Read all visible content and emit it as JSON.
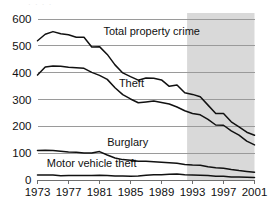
{
  "chart_data": {
    "type": "line",
    "title": "",
    "subtitle": "",
    "xlabel": "",
    "ylabel": "",
    "xlim": [
      1973,
      2001
    ],
    "ylim": [
      0,
      600
    ],
    "grid": true,
    "legend_position": "inline-labels",
    "x_tick_labels": [
      "1973",
      "1977",
      "1981",
      "1985",
      "1989",
      "1993",
      "1997",
      "2001"
    ],
    "x_ticks": [
      1973,
      1977,
      1981,
      1985,
      1989,
      1993,
      1997,
      2001
    ],
    "y_tick_labels": [
      "0",
      "100",
      "200",
      "300",
      "400",
      "500",
      "600"
    ],
    "y_ticks": [
      0,
      100,
      200,
      300,
      400,
      500,
      600
    ],
    "x": [
      1973,
      1974,
      1975,
      1976,
      1977,
      1978,
      1979,
      1980,
      1981,
      1982,
      1983,
      1984,
      1985,
      1986,
      1987,
      1988,
      1989,
      1990,
      1991,
      1992,
      1993,
      1994,
      1995,
      1996,
      1997,
      1998,
      1999,
      2000,
      2001
    ],
    "shaded_region": {
      "x_start": 1992.3,
      "x_end": 2001,
      "color": "#d2d2d2",
      "note": "redesign of survey methodology"
    },
    "series": [
      {
        "name": "Total property crime",
        "label": "Total property crime",
        "label_x": 1981.5,
        "label_y": 540,
        "color": "#111111",
        "values": [
          519,
          543,
          553,
          545,
          541,
          532,
          532,
          496,
          497,
          468,
          429,
          399,
          385,
          372,
          380,
          379,
          373,
          349,
          354,
          325,
          319,
          310,
          279,
          248,
          248,
          217,
          198,
          178,
          167
        ]
      },
      {
        "name": "Theft",
        "label": "Theft",
        "label_x": 1983.5,
        "label_y": 345,
        "color": "#111111",
        "values": [
          391,
          421,
          425,
          424,
          420,
          418,
          416,
          401,
          390,
          375,
          344,
          318,
          302,
          288,
          291,
          294,
          289,
          283,
          272,
          258,
          248,
          243,
          226,
          205,
          204,
          183,
          167,
          145,
          131
        ]
      },
      {
        "name": "Burglary",
        "label": "Burglary",
        "label_x": 1982.0,
        "label_y": 128,
        "color": "#111111",
        "values": [
          110,
          111,
          110,
          107,
          104,
          103,
          101,
          101,
          106,
          93,
          82,
          76,
          74,
          70,
          70,
          68,
          66,
          64,
          62,
          58,
          56,
          55,
          49,
          46,
          44,
          39,
          35,
          32,
          29
        ]
      },
      {
        "name": "Motor vehicle theft",
        "label": "Motor vehicle theft",
        "label_x": 1974.2,
        "label_y": 48,
        "color": "#111111",
        "values": [
          19,
          19,
          19,
          16,
          17,
          17,
          17,
          17,
          18,
          17,
          15,
          15,
          14,
          15,
          18,
          20,
          20,
          21,
          22,
          20,
          19,
          18,
          17,
          14,
          14,
          11,
          11,
          10,
          9
        ]
      }
    ]
  },
  "ghost_header": "· · · ·"
}
